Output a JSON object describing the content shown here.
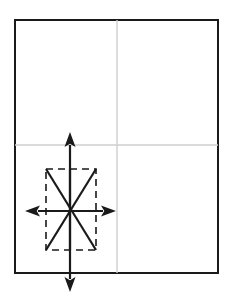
{
  "diagram": {
    "canvas": {
      "width": 230,
      "height": 302,
      "background": "#ffffff"
    },
    "colors": {
      "paper_outline": "#1a1a1a",
      "fold_line": "#cfcfcf",
      "crease_line": "#1a1a1a",
      "dashed_line": "#1a1a1a",
      "arrow": "#1a1a1a",
      "paper_fill": "#ffffff"
    },
    "paper_sheet": {
      "label": "paper sheet",
      "x": 15,
      "y": 20,
      "width": 203,
      "height": 253,
      "stroke_width": 2.6
    },
    "fold_lines": [
      {
        "label": "vertical center fold",
        "orientation": "vertical",
        "x": 117,
        "y1": 20,
        "y2": 273,
        "stroke_width": 1.4
      },
      {
        "label": "horizontal center fold",
        "orientation": "horizontal",
        "y": 145,
        "x1": 15,
        "x2": 218,
        "stroke_width": 1.4
      }
    ],
    "dashed_region": {
      "label": "squash fold region",
      "x": 46,
      "y": 169,
      "width": 50,
      "height": 81,
      "stroke_width": 1.6,
      "dash_pattern": "7 5"
    },
    "crease_x": {
      "label": "x crossing creases",
      "stroke_width": 2.2,
      "segments": [
        {
          "name": "crease-down-right",
          "x1": 46,
          "y1": 169,
          "x2": 96,
          "y2": 250
        },
        {
          "name": "crease-down-left",
          "x1": 96,
          "y1": 169,
          "x2": 46,
          "y2": 250
        }
      ],
      "crossing_point": {
        "x": 71,
        "y": 210
      }
    },
    "arrows": [
      {
        "name": "arrow-up",
        "direction": "up",
        "from": {
          "x": 70,
          "y": 250
        },
        "to": {
          "x": 70,
          "y": 132
        },
        "shaft_width": 2.2,
        "head_length": 15,
        "head_width": 11
      },
      {
        "name": "arrow-down",
        "direction": "down",
        "from": {
          "x": 70,
          "y": 169
        },
        "to": {
          "x": 70,
          "y": 292
        },
        "shaft_width": 2.2,
        "head_length": 15,
        "head_width": 11
      },
      {
        "name": "arrow-left",
        "direction": "left",
        "from": {
          "x": 96,
          "y": 211
        },
        "to": {
          "x": 25,
          "y": 211
        },
        "shaft_width": 2.2,
        "head_length": 15,
        "head_width": 11
      },
      {
        "name": "arrow-right",
        "direction": "right",
        "from": {
          "x": 46,
          "y": 211
        },
        "to": {
          "x": 116,
          "y": 211
        },
        "shaft_width": 2.2,
        "head_length": 15,
        "head_width": 11
      }
    ]
  }
}
